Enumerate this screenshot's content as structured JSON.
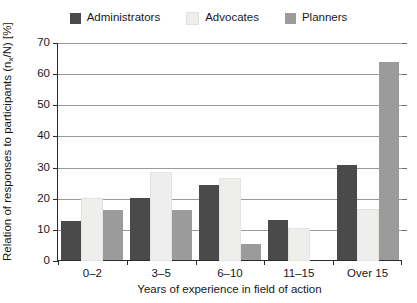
{
  "chart_data": {
    "type": "bar",
    "title": "",
    "xlabel": "Years of experience in field of action",
    "ylabel": "Relation of responses to participants (nₓ/N) [%]",
    "ylabel_main": "Relation of responses to participants (n",
    "ylabel_sub": "x",
    "ylabel_tail": "/N) [%]",
    "categories": [
      "0–2",
      "3–5",
      "6–10",
      "11–15",
      "Over 15"
    ],
    "series": [
      {
        "name": "Administrators",
        "color": "#4a4a4a",
        "values": [
          12.5,
          20,
          24,
          13,
          30.5
        ]
      },
      {
        "name": "Advocates",
        "color": "#eeeeec",
        "values": [
          19.5,
          28,
          26,
          10,
          16
        ]
      },
      {
        "name": "Planners",
        "color": "#9b9b9b",
        "values": [
          16,
          16,
          5,
          0,
          63.5
        ]
      }
    ],
    "ylim": [
      0,
      70
    ],
    "yticks": [
      0,
      10,
      20,
      30,
      40,
      50,
      60,
      70
    ],
    "ytick_labels": [
      "0",
      "10",
      "20",
      "30",
      "40",
      "50",
      "60",
      "70"
    ],
    "grid": true,
    "legend_position": "top"
  }
}
